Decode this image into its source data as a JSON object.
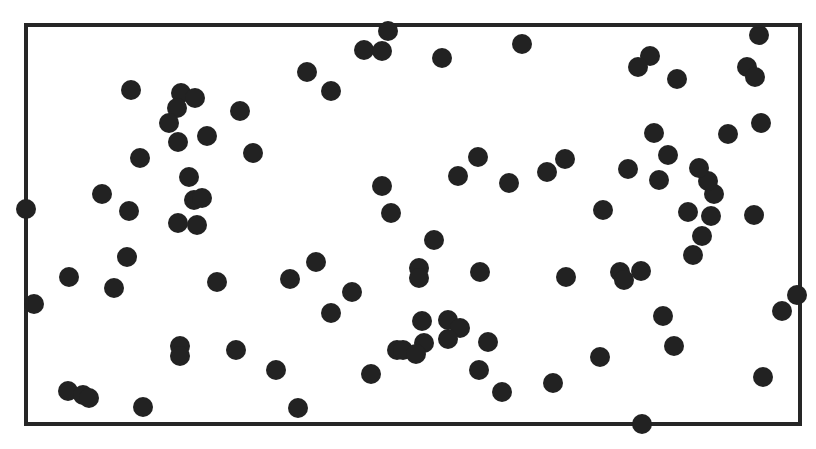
{
  "figure": {
    "width": 816,
    "height": 449,
    "background": "#ffffff",
    "frame": {
      "x1": 26,
      "y1": 25,
      "x2": 800,
      "y2": 424,
      "stroke": "#262626",
      "stroke_width": 4
    },
    "dot_color": "#222222",
    "dot_radius": 10
  },
  "chart_data": {
    "type": "scatter",
    "title": "",
    "xlabel": "",
    "ylabel": "",
    "grid": false,
    "legend": null,
    "coordinate_space": "pixel",
    "points": [
      [
        26,
        209
      ],
      [
        34,
        304
      ],
      [
        69,
        277
      ],
      [
        68,
        391
      ],
      [
        83,
        395
      ],
      [
        89,
        398
      ],
      [
        143,
        407
      ],
      [
        102,
        194
      ],
      [
        129,
        211
      ],
      [
        127,
        257
      ],
      [
        114,
        288
      ],
      [
        131,
        90
      ],
      [
        140,
        158
      ],
      [
        181,
        93
      ],
      [
        195,
        98
      ],
      [
        177,
        108
      ],
      [
        169,
        123
      ],
      [
        178,
        142
      ],
      [
        207,
        136
      ],
      [
        240,
        111
      ],
      [
        253,
        153
      ],
      [
        189,
        177
      ],
      [
        194,
        200
      ],
      [
        202,
        198
      ],
      [
        178,
        223
      ],
      [
        197,
        225
      ],
      [
        217,
        282
      ],
      [
        180,
        346
      ],
      [
        180,
        356
      ],
      [
        236,
        350
      ],
      [
        276,
        370
      ],
      [
        298,
        408
      ],
      [
        290,
        279
      ],
      [
        316,
        262
      ],
      [
        352,
        292
      ],
      [
        331,
        313
      ],
      [
        307,
        72
      ],
      [
        331,
        91
      ],
      [
        364,
        50
      ],
      [
        382,
        51
      ],
      [
        388,
        31
      ],
      [
        442,
        58
      ],
      [
        522,
        44
      ],
      [
        382,
        186
      ],
      [
        391,
        213
      ],
      [
        434,
        240
      ],
      [
        458,
        176
      ],
      [
        478,
        157
      ],
      [
        509,
        183
      ],
      [
        547,
        172
      ],
      [
        565,
        159
      ],
      [
        419,
        268
      ],
      [
        419,
        278
      ],
      [
        480,
        272
      ],
      [
        566,
        277
      ],
      [
        371,
        374
      ],
      [
        397,
        350
      ],
      [
        422,
        321
      ],
      [
        448,
        320
      ],
      [
        460,
        328
      ],
      [
        448,
        339
      ],
      [
        424,
        343
      ],
      [
        403,
        350
      ],
      [
        416,
        354
      ],
      [
        488,
        342
      ],
      [
        479,
        370
      ],
      [
        502,
        392
      ],
      [
        553,
        383
      ],
      [
        603,
        210
      ],
      [
        600,
        357
      ],
      [
        620,
        272
      ],
      [
        624,
        280
      ],
      [
        641,
        271
      ],
      [
        663,
        316
      ],
      [
        674,
        346
      ],
      [
        642,
        424
      ],
      [
        693,
        255
      ],
      [
        702,
        236
      ],
      [
        688,
        212
      ],
      [
        711,
        216
      ],
      [
        714,
        194
      ],
      [
        708,
        181
      ],
      [
        699,
        168
      ],
      [
        668,
        155
      ],
      [
        659,
        180
      ],
      [
        628,
        169
      ],
      [
        654,
        133
      ],
      [
        728,
        134
      ],
      [
        761,
        123
      ],
      [
        650,
        56
      ],
      [
        638,
        67
      ],
      [
        677,
        79
      ],
      [
        747,
        67
      ],
      [
        755,
        77
      ],
      [
        759,
        35
      ],
      [
        754,
        215
      ],
      [
        797,
        295
      ],
      [
        782,
        311
      ],
      [
        763,
        377
      ]
    ]
  }
}
